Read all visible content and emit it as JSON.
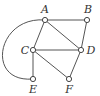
{
  "graph": {
    "nodes": [
      {
        "id": "A",
        "label": "A",
        "x": 45,
        "y": 20,
        "lx": 45,
        "ly": 13,
        "anchor": "middle"
      },
      {
        "id": "B",
        "label": "B",
        "x": 87,
        "y": 20,
        "lx": 88,
        "ly": 13,
        "anchor": "middle"
      },
      {
        "id": "C",
        "label": "C",
        "x": 33,
        "y": 50,
        "lx": 25,
        "ly": 54,
        "anchor": "middle"
      },
      {
        "id": "D",
        "label": "D",
        "x": 81,
        "y": 50,
        "lx": 91,
        "ly": 54,
        "anchor": "middle"
      },
      {
        "id": "E",
        "label": "E",
        "x": 33,
        "y": 79,
        "lx": 33,
        "ly": 93,
        "anchor": "middle"
      },
      {
        "id": "F",
        "label": "F",
        "x": 69,
        "y": 79,
        "lx": 69,
        "ly": 93,
        "anchor": "middle"
      }
    ],
    "edges": [
      {
        "from": "A",
        "to": "B",
        "type": "straight"
      },
      {
        "from": "A",
        "to": "C",
        "type": "straight"
      },
      {
        "from": "A",
        "to": "D",
        "type": "straight"
      },
      {
        "from": "B",
        "to": "D",
        "type": "straight"
      },
      {
        "from": "C",
        "to": "D",
        "type": "straight"
      },
      {
        "from": "C",
        "to": "E",
        "type": "straight"
      },
      {
        "from": "C",
        "to": "F",
        "type": "straight"
      },
      {
        "from": "D",
        "to": "F",
        "type": "straight"
      },
      {
        "from": "A",
        "to": "E",
        "type": "arc"
      }
    ]
  }
}
